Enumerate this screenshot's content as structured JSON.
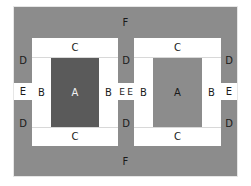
{
  "diagram": {
    "type": "layout-zones",
    "colors": {
      "gray": "#8c8c8c",
      "dark": "#5a5a5a",
      "white": "#ffffff"
    },
    "labels": {
      "F_top": "F",
      "F_bottom": "F",
      "C_left_top": "C",
      "C_left_bottom": "C",
      "C_right_top": "C",
      "C_right_bottom": "C",
      "D_left_top": "D",
      "D_left_bottom": "D",
      "D_mid_left_top": "D",
      "D_mid_left_bottom": "D",
      "D_right_top": "D",
      "D_right_bottom": "D",
      "E_left": "E",
      "E_mid_left": "E",
      "E_mid_right": "E",
      "E_right": "E",
      "B_left_1": "B",
      "B_left_2": "B",
      "B_right_1": "B",
      "B_right_2": "B",
      "A_left": "A",
      "A_right": "A"
    }
  }
}
